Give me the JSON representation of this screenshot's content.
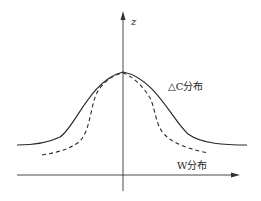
{
  "diagram": {
    "axis_labels": {
      "vertical": "z",
      "horizontal": "W分布"
    },
    "curve_labels": {
      "solid": "△C分布"
    },
    "colors": {
      "line": "#2a2a2a",
      "axis": "#333333",
      "background": "#ffffff"
    },
    "curves": [
      {
        "name": "solid-curve",
        "style": "solid",
        "description": "wide bell-shaped ΔC distribution"
      },
      {
        "name": "dashed-curve",
        "style": "dashed",
        "description": "narrower bell-shaped distribution"
      }
    ]
  }
}
